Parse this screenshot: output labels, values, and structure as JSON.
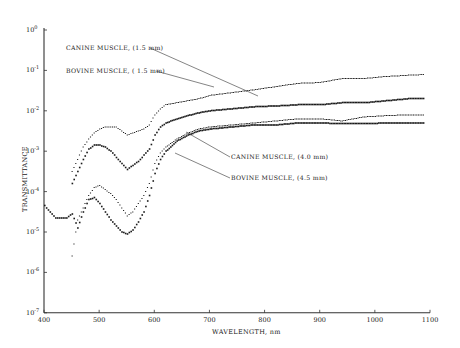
{
  "chart_data": {
    "type": "scatter",
    "title": "",
    "xlabel": "WAVELENGTH, nm",
    "ylabel": "TRANSMITTANCE",
    "xlim": [
      400,
      1100
    ],
    "ylim": [
      1e-07,
      1
    ],
    "yscale": "log",
    "grid": false,
    "x_ticks": [
      400,
      500,
      600,
      700,
      800,
      900,
      1000,
      1100
    ],
    "y_ticks": [
      {
        "exp": 0,
        "label": "10",
        "sup": "0"
      },
      {
        "exp": -1,
        "label": "10",
        "sup": "-1"
      },
      {
        "exp": -2,
        "label": "10",
        "sup": "-2"
      },
      {
        "exp": -3,
        "label": "10",
        "sup": "-3"
      },
      {
        "exp": -4,
        "label": "10",
        "sup": "-4"
      },
      {
        "exp": -5,
        "label": "10",
        "sup": "-5"
      },
      {
        "exp": -6,
        "label": "10",
        "sup": "-6"
      },
      {
        "exp": -7,
        "label": "10",
        "sup": "-7"
      }
    ],
    "series": [
      {
        "name": "CANINE MUSCLE, (1.5 mm)",
        "style": "dotted",
        "label_pos": [
          66,
          48
        ],
        "arrow_to": [
          260,
          95
        ],
        "x": [
          450,
          460,
          470,
          480,
          490,
          500,
          510,
          520,
          530,
          540,
          550,
          560,
          570,
          580,
          590,
          600,
          610,
          620,
          640,
          660,
          680,
          700,
          740,
          780,
          820,
          860,
          900,
          940,
          980,
          1020,
          1060,
          1090
        ],
        "log10": [
          -3.5,
          -3.2,
          -2.9,
          -2.7,
          -2.55,
          -2.45,
          -2.4,
          -2.4,
          -2.4,
          -2.5,
          -2.6,
          -2.55,
          -2.5,
          -2.45,
          -2.35,
          -2.1,
          -1.95,
          -1.85,
          -1.8,
          -1.75,
          -1.7,
          -1.62,
          -1.55,
          -1.48,
          -1.4,
          -1.32,
          -1.3,
          -1.2,
          -1.2,
          -1.15,
          -1.12,
          -1.1
        ]
      },
      {
        "name": "BOVINE MUSCLE, (1.5 mm)",
        "style": "solid-dots",
        "label_pos": [
          66,
          71
        ],
        "arrow_to": [
          215,
          87
        ],
        "x": [
          450,
          460,
          470,
          480,
          490,
          500,
          510,
          520,
          530,
          540,
          550,
          560,
          570,
          580,
          590,
          600,
          610,
          620,
          640,
          660,
          680,
          700,
          740,
          780,
          820,
          860,
          900,
          940,
          980,
          1020,
          1060,
          1090
        ],
        "log10": [
          -3.8,
          -3.5,
          -3.2,
          -2.95,
          -2.85,
          -2.85,
          -2.9,
          -3.0,
          -3.15,
          -3.3,
          -3.45,
          -3.35,
          -3.25,
          -3.1,
          -2.95,
          -2.6,
          -2.4,
          -2.3,
          -2.2,
          -2.12,
          -2.05,
          -2.0,
          -1.95,
          -1.9,
          -1.88,
          -1.85,
          -1.85,
          -1.8,
          -1.8,
          -1.75,
          -1.7,
          -1.7
        ]
      },
      {
        "name": "CANINE MUSCLE, (4.0 mm)",
        "style": "dotted",
        "label_pos": [
          232,
          157
        ],
        "arrow_to": [
          186,
          131
        ],
        "x": [
          450,
          460,
          470,
          480,
          490,
          500,
          510,
          520,
          530,
          540,
          550,
          560,
          570,
          580,
          590,
          600,
          610,
          620,
          640,
          660,
          680,
          700,
          740,
          780,
          820,
          860,
          900,
          940,
          980,
          1020,
          1060,
          1090
        ],
        "log10": [
          -5.6,
          -4.7,
          -4.4,
          -4.1,
          -3.9,
          -3.85,
          -3.95,
          -4.05,
          -4.2,
          -4.4,
          -4.6,
          -4.5,
          -4.3,
          -4.1,
          -3.8,
          -3.3,
          -3.05,
          -2.9,
          -2.7,
          -2.55,
          -2.45,
          -2.4,
          -2.35,
          -2.3,
          -2.25,
          -2.2,
          -2.2,
          -2.25,
          -2.15,
          -2.12,
          -2.1,
          -2.1
        ]
      },
      {
        "name": "BOVINE MUSCLE, (4.5 mm)",
        "style": "solid-dots",
        "label_pos": [
          232,
          177
        ],
        "arrow_to": [
          175,
          153
        ],
        "x": [
          400,
          410,
          420,
          430,
          440,
          450,
          460,
          470,
          480,
          490,
          500,
          510,
          520,
          530,
          540,
          550,
          560,
          570,
          580,
          590,
          600,
          610,
          620,
          640,
          660,
          680,
          700,
          740,
          780,
          820,
          860,
          900,
          940,
          980,
          1020,
          1060,
          1090
        ],
        "log10": [
          -4.35,
          -4.5,
          -4.65,
          -4.65,
          -4.65,
          -4.55,
          -4.9,
          -4.5,
          -4.2,
          -4.15,
          -4.3,
          -4.5,
          -4.7,
          -4.85,
          -5.0,
          -5.05,
          -4.95,
          -4.75,
          -4.5,
          -4.1,
          -3.55,
          -3.2,
          -3.0,
          -2.75,
          -2.6,
          -2.5,
          -2.45,
          -2.4,
          -2.35,
          -2.35,
          -2.3,
          -2.3,
          -2.32,
          -2.32,
          -2.3,
          -2.3,
          -2.3
        ]
      }
    ]
  },
  "labels": {
    "xlabel": "WAVELENGTH, nm",
    "ylabel": "TRANSMITTANCE",
    "s0": "CANINE MUSCLE, (1.5 mm)",
    "s1": "BOVINE MUSCLE, ( 1.5 mm)",
    "s2": "CANINE MUSCLE, (4.0 mm)",
    "s3": "BOVINE MUSCLE, (4.5 mm)"
  }
}
